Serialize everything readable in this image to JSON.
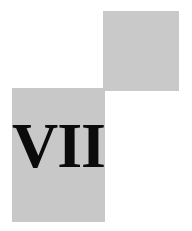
{
  "page": {
    "background_color": "#ffffff",
    "width": 192,
    "height": 231
  },
  "decor": {
    "top_block": {
      "name": "upper-right-gray-square",
      "color": "#c8c9c8"
    },
    "main_block": {
      "name": "lower-left-gray-panel",
      "color": "#c7c8c7"
    }
  },
  "content": {
    "numeral": "VII",
    "numeral_color": "#0b0b0b"
  }
}
